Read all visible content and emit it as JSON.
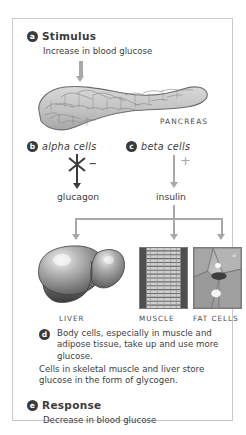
{
  "figure": {
    "border_color": "#c8c8c8",
    "background": "#ffffff"
  },
  "steps": {
    "a": {
      "badge": "a",
      "heading": "Stimulus",
      "text": "Increase in blood glucose"
    },
    "b": {
      "badge": "b",
      "label": "alpha cells",
      "sign": "–",
      "hormone": "glucagon",
      "effect": "inhibited"
    },
    "c": {
      "badge": "c",
      "label": "beta cells",
      "sign": "+",
      "hormone": "insulin",
      "effect": "stimulated"
    },
    "d": {
      "badge": "d",
      "text": "Body cells, especially in muscle and adipose tissue, take up and use more glucose.",
      "text2": "Cells in skeletal muscle and liver store glucose in the form of glycogen."
    },
    "e": {
      "badge": "e",
      "heading": "Response",
      "text": "Decrease in blood glucose"
    }
  },
  "organs": {
    "pancreas_label": "PANCREAS",
    "targets": [
      {
        "name": "liver",
        "label": "LIVER"
      },
      {
        "name": "muscle",
        "label": "MUSCLE"
      },
      {
        "name": "fat",
        "label": "FAT CELLS"
      }
    ]
  },
  "icons": {
    "stimulus_arrow": "down-arrow-icon",
    "inhibition": "x-cross-icon",
    "branch": "branching-arrow-icon"
  },
  "colors": {
    "arrow_gray": "#a8a8a8",
    "dark_arrow": "#3b3b3b",
    "badge_fill": "#3a3a3a",
    "text": "#3d3d3d"
  }
}
